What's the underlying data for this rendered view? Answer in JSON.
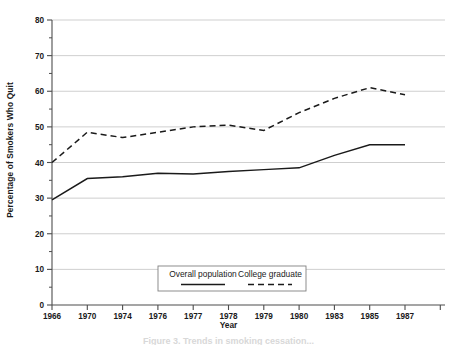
{
  "chart_data": {
    "type": "line",
    "title": "",
    "xlabel": "Year",
    "ylabel": "Percentage of Smokers Who Quit",
    "categories": [
      "1966",
      "1970",
      "1974",
      "1976",
      "1977",
      "1978",
      "1979",
      "1980",
      "1983",
      "1985",
      "1987"
    ],
    "ylim": [
      0,
      80
    ],
    "yticks": [
      0,
      10,
      20,
      30,
      40,
      50,
      60,
      70,
      80
    ],
    "ytick_labels": [
      "0",
      "10",
      "20",
      "30",
      "40",
      "50",
      "60",
      "70",
      "80"
    ],
    "minor_ytick_step": 5,
    "grid": "horizontal-major",
    "legend_position": "inside-bottom-center",
    "series": [
      {
        "name": "Overall population",
        "style": "solid",
        "color": "#1a1a1a",
        "values": [
          29.5,
          35.5,
          36.0,
          37.0,
          36.8,
          37.5,
          38.0,
          38.5,
          42.0,
          45.0,
          45.0
        ]
      },
      {
        "name": "College graduate",
        "style": "dashed",
        "color": "#1a1a1a",
        "values": [
          40.0,
          48.5,
          47.0,
          48.5,
          50.0,
          50.5,
          49.0,
          54.0,
          58.0,
          61.0,
          59.0
        ]
      }
    ]
  },
  "axes": {
    "ylabel": "Percentage of Smokers Who Quit",
    "xlabel": "Year"
  },
  "legend": {
    "entries": [
      {
        "label": "Overall population",
        "style": "solid"
      },
      {
        "label": "College graduate",
        "style": "dashed"
      }
    ]
  },
  "caption": {
    "text": "Figure 3.  Trends in smoking cessation..."
  },
  "colors": {
    "ink": "#1a1a1a",
    "grid": "#c9c9c9",
    "axis": "#4d4d4d",
    "background": "#ffffff"
  }
}
